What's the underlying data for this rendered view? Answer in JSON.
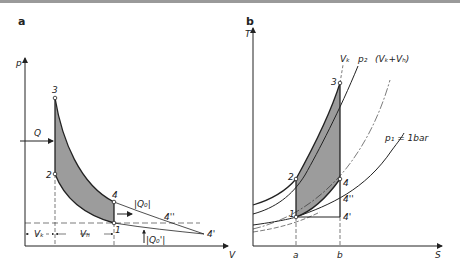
{
  "panels": [
    {
      "id": "a",
      "label": "a",
      "x_axis": "V",
      "y_axis": "p",
      "points": {
        "p1": "1",
        "p2": "2",
        "p3": "3",
        "p4": "4",
        "p4p": "4'",
        "p4pp": "4''"
      },
      "annotations": {
        "Q": "Q",
        "Q0": "|Q₀|",
        "Q0p": "|Q₀'|",
        "Vk": "Vₖ",
        "Vh": "Vₕ"
      }
    },
    {
      "id": "b",
      "label": "b",
      "x_axis": "S",
      "y_axis": "T",
      "points": {
        "p1": "1",
        "p2": "2",
        "p3": "3",
        "p4": "4",
        "p4p": "4'",
        "p4pp": "4''"
      },
      "curves": {
        "vk": "Vₖ",
        "p2": "p₂",
        "vkvh": "(Vₖ+Vₕ)",
        "p1": "p₁ = 1bar"
      },
      "ticks": {
        "a": "a",
        "b": "b"
      }
    }
  ],
  "colors": {
    "line": "#222222",
    "fill": "#9c9c9c",
    "bg": "#ffffff"
  }
}
